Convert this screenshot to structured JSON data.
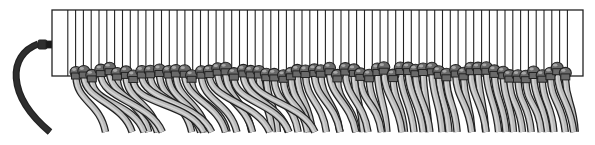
{
  "illustration": {
    "subject": "patch-panel-with-cables",
    "width": 595,
    "height": 145,
    "colors": {
      "background": "#ffffff",
      "outline": "#222222",
      "panel_fill": "#ffffff",
      "cable_fill": "#bdbdbd",
      "cable_highlight": "#d6d6d6",
      "connector_fill": "#6a6a6a",
      "connector_shine": "#a8a8a8",
      "power_cord": "#2e2e2e"
    },
    "panel": {
      "x": 52,
      "y": 10,
      "width": 531,
      "height": 66,
      "port_lines": 66
    },
    "power_cord": {
      "plug_x": 38,
      "plug_y": 40,
      "end_x": 50,
      "end_y": 132
    },
    "cable_groups": [
      {
        "start": 75,
        "end": 258,
        "count": 22,
        "sway": 60
      },
      {
        "start": 258,
        "end": 415,
        "count": 20,
        "sway": 22
      },
      {
        "start": 415,
        "end": 572,
        "count": 20,
        "sway": 14
      }
    ],
    "cable_bottom_y": 132
  }
}
